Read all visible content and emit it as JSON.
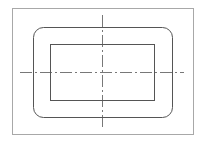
{
  "drawing": {
    "type": "technical-drawing",
    "colors": {
      "background": "#ffffff",
      "frame": "#a8a8a8",
      "outline": "#555555",
      "centerline": "#555555"
    },
    "frame": {
      "x": 12,
      "y": 8,
      "width": 181,
      "height": 126
    },
    "rounded_rect": {
      "x": 33,
      "y": 27,
      "width": 139,
      "height": 90,
      "radius": 10
    },
    "inner_rect": {
      "x": 50,
      "y": 44,
      "width": 104,
      "height": 56
    },
    "centerlines": {
      "horizontal": {
        "x1": 20,
        "y": 72,
        "x2": 184
      },
      "vertical": {
        "x": 102,
        "y1": 15,
        "y2": 127
      },
      "dash_pattern": "12 3 2 3"
    }
  }
}
